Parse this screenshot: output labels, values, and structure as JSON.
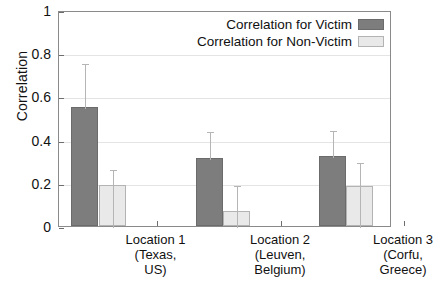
{
  "chart_data": {
    "type": "bar",
    "title": "",
    "xlabel": "",
    "ylabel": "Correlation",
    "ylim": [
      0,
      1
    ],
    "yticks": [
      "0",
      "0.2",
      "0.4",
      "0.6",
      "0.8",
      "1"
    ],
    "ytick_values": [
      0,
      0.2,
      0.4,
      0.6,
      0.8,
      1
    ],
    "grid": true,
    "legend_position": "top-right",
    "categories": [
      "Location 1\n(Texas,\nUS)",
      "Location 2\n(Leuven,\nBelgium)",
      "Location 3\n(Corfu,\nGreece)"
    ],
    "category_lines": [
      [
        "Location 1",
        "(Texas,",
        "US)"
      ],
      [
        "Location 2",
        "(Leuven,",
        "Belgium)"
      ],
      [
        "Location 3",
        "(Corfu,",
        "Greece)"
      ]
    ],
    "series": [
      {
        "name": "Correlation for Victim",
        "color": "#7d7d7d",
        "values": [
          0.55,
          0.315,
          0.325
        ],
        "errors_upper": [
          0.76,
          0.445,
          0.45
        ],
        "errors_lower": [
          0.55,
          0.315,
          0.325
        ]
      },
      {
        "name": "Correlation for Non-Victim",
        "color": "#e9e9e9",
        "values": [
          0.19,
          0.07,
          0.185
        ],
        "errors_upper": [
          0.27,
          0.195,
          0.3
        ],
        "errors_lower": [
          0.0,
          0.0,
          0.0
        ]
      }
    ]
  },
  "legend": {
    "items": [
      {
        "label": "Correlation for Victim",
        "swatch": "victim"
      },
      {
        "label": "Correlation for Non-Victim",
        "swatch": "nonvictim"
      }
    ]
  },
  "axes": {
    "y_title": "Correlation"
  }
}
